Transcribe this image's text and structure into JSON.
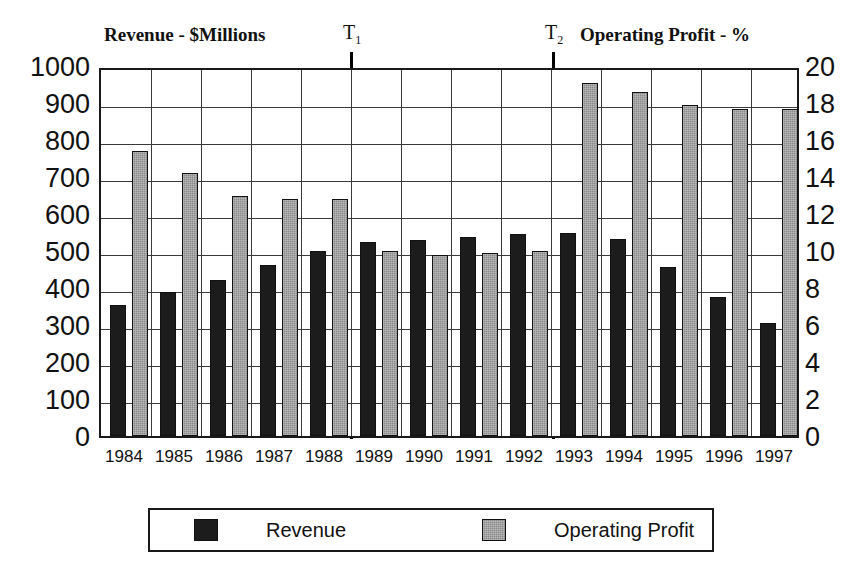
{
  "titles": {
    "left": "Revenue - $Millions",
    "right": "Operating Profit - %"
  },
  "markers": [
    {
      "label": "T",
      "sub": "1"
    },
    {
      "label": "T",
      "sub": "2"
    }
  ],
  "legend": {
    "revenue_label": "Revenue",
    "profit_label": "Operating Profit"
  },
  "colors": {
    "revenue": "#1c1c1c",
    "profit": "#8a8a8a",
    "axis": "#1a1a1a",
    "grid": "#3a3a3a"
  },
  "chart_data": {
    "type": "bar",
    "xlabel": "",
    "ylabel": "Revenue - $Millions",
    "y2label": "Operating Profit - %",
    "ylim": [
      0,
      1000
    ],
    "y2lim": [
      0,
      20
    ],
    "yticks": [
      0,
      100,
      200,
      300,
      400,
      500,
      600,
      700,
      800,
      900,
      1000
    ],
    "y2ticks": [
      0,
      2,
      4,
      6,
      8,
      10,
      12,
      14,
      16,
      18,
      20
    ],
    "ytick_labels": [
      "0",
      "100",
      "200",
      "300",
      "400",
      "500",
      "600",
      "700",
      "800",
      "900",
      "1000"
    ],
    "y2tick_labels": [
      "0",
      "2",
      "4",
      "6",
      "8",
      "10",
      "12",
      "14",
      "16",
      "18",
      "20"
    ],
    "grid": true,
    "legend_position": "bottom",
    "categories": [
      "1984",
      "1985",
      "1986",
      "1987",
      "1988",
      "1989",
      "1990",
      "1991",
      "1992",
      "1993",
      "1994",
      "1995",
      "1996",
      "1997"
    ],
    "series": [
      {
        "name": "Revenue",
        "axis": "left",
        "unit": "$Millions",
        "values": [
          355,
          388,
          422,
          462,
          500,
          525,
          530,
          538,
          545,
          548,
          533,
          458,
          375,
          305
        ]
      },
      {
        "name": "Operating Profit",
        "axis": "right",
        "unit": "%",
        "values": [
          15.4,
          14.2,
          13.0,
          12.8,
          12.8,
          10.0,
          9.8,
          9.9,
          10.0,
          19.1,
          18.6,
          17.9,
          17.7,
          17.7
        ]
      }
    ],
    "annotations": [
      {
        "text": "T1",
        "type": "vertical-line",
        "between": [
          "1988",
          "1989"
        ]
      },
      {
        "text": "T2",
        "type": "vertical-line",
        "between": [
          "1992",
          "1993"
        ]
      }
    ]
  }
}
